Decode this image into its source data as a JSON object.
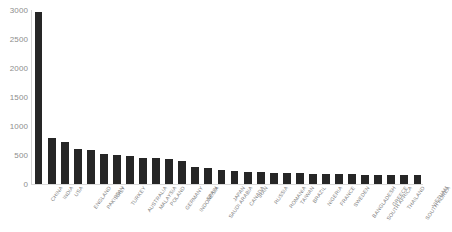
{
  "chart_data": {
    "type": "bar",
    "title": "",
    "subtitle": "",
    "xlabel": "",
    "ylabel": "",
    "ylim": [
      0,
      3000
    ],
    "ytick_step": 500,
    "yticks": [
      "0",
      "500",
      "1000",
      "1500",
      "2000",
      "2500",
      "3000"
    ],
    "ytick_values": [
      0,
      500,
      1000,
      1500,
      2000,
      2500,
      3000
    ],
    "grid": false,
    "legend": null,
    "legend_position": "none",
    "bar_color": "#262626",
    "background_color": "#ffffff",
    "axis_color": "#d4d4d4",
    "tick_label_color": "#8d8d8d",
    "categories": [
      "CHINA",
      "INDIA",
      "USA",
      "ENGLAND",
      "PAKISTAN",
      "ITALY",
      "TURKEY",
      "AUSTRALIA",
      "MALAYSIA",
      "POLAND",
      "GERMANY",
      "INDONESIA",
      "SPAIN",
      "SAUDI ARABIA",
      "JAPAN",
      "CANADA",
      "IRAN",
      "RUSSIA",
      "ROMANIA",
      "TAIWAN",
      "BRAZIL",
      "NIGERIA",
      "FRANCE",
      "SWEDEN",
      "BANGLADESH",
      "SOUTH AFRICA",
      "GREECE",
      "THAILAND",
      "SOUTH KOREA",
      "VIETNAM"
    ],
    "values": [
      2960,
      790,
      720,
      600,
      580,
      520,
      500,
      480,
      450,
      440,
      430,
      390,
      300,
      270,
      250,
      230,
      205,
      200,
      195,
      190,
      185,
      180,
      175,
      170,
      165,
      160,
      158,
      155,
      150,
      148
    ]
  }
}
